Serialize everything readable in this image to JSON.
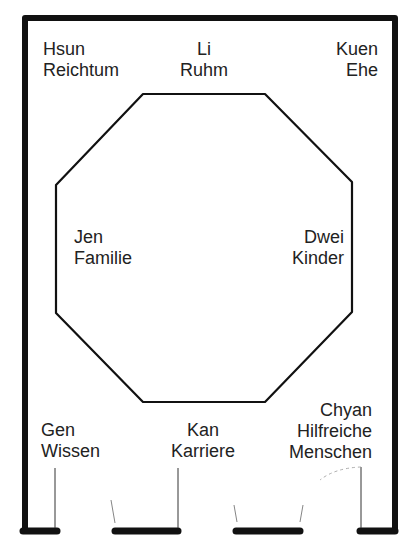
{
  "diagram": {
    "type": "bagua-floor-plan",
    "colors": {
      "wall": "#111111",
      "octagon": "#111111",
      "text": "#222222",
      "door_line": "#333333",
      "background": "#ffffff"
    },
    "zones": [
      {
        "id": "hsun",
        "name": "Hsun",
        "meaning": "Reichtum",
        "position": "top-left"
      },
      {
        "id": "li",
        "name": "Li",
        "meaning": "Ruhm",
        "position": "top-center"
      },
      {
        "id": "kuen",
        "name": "Kuen",
        "meaning": "Ehe",
        "position": "top-right"
      },
      {
        "id": "jen",
        "name": "Jen",
        "meaning": "Familie",
        "position": "middle-left"
      },
      {
        "id": "dwei",
        "name": "Dwei",
        "meaning": "Kinder",
        "position": "middle-right"
      },
      {
        "id": "gen",
        "name": "Gen",
        "meaning": "Wissen",
        "position": "bottom-left"
      },
      {
        "id": "kan",
        "name": "Kan",
        "meaning": "Karriere",
        "position": "bottom-center"
      },
      {
        "id": "chyan",
        "name": "Chyan",
        "meaning_line1": "Hilfreiche",
        "meaning_line2": "Menschen",
        "position": "bottom-right"
      }
    ]
  }
}
